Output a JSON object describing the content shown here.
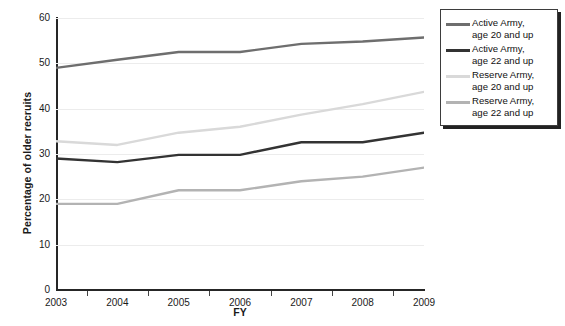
{
  "chart_data": {
    "type": "line",
    "title": "",
    "xlabel": "FY",
    "ylabel": "Percentage of older recruits",
    "categories": [
      "2003",
      "2004",
      "2005",
      "2006",
      "2007",
      "2008",
      "2009"
    ],
    "x": [
      2003,
      2004,
      2005,
      2006,
      2007,
      2008,
      2009
    ],
    "xlim": [
      2003,
      2009
    ],
    "ylim": [
      0,
      60
    ],
    "yticks": [
      0,
      10,
      20,
      30,
      40,
      50,
      60
    ],
    "ytick_labels": [
      "0",
      "10",
      "20",
      "30",
      "40",
      "50",
      "60"
    ],
    "grid": true,
    "grid_axis": "y",
    "legend_position": "right",
    "series": [
      {
        "name": "Active Army,\nage 20 and up",
        "color": "#6e6e6e",
        "values": [
          49.0,
          50.8,
          52.5,
          52.5,
          54.3,
          54.8,
          55.7
        ]
      },
      {
        "name": "Active Army,\nage 22 and up",
        "color": "#333333",
        "values": [
          29.0,
          28.2,
          29.8,
          29.8,
          32.6,
          32.6,
          34.7
        ]
      },
      {
        "name": "Reserve Army,\nage 20 and up",
        "color": "#d9d9d9",
        "values": [
          32.8,
          32.0,
          34.7,
          36.0,
          38.7,
          41.0,
          43.7
        ]
      },
      {
        "name": "Reserve Army,\nage 22 and up",
        "color": "#b3b3b3",
        "values": [
          19.0,
          19.0,
          22.0,
          22.0,
          24.0,
          25.0,
          27.0
        ]
      }
    ]
  },
  "legend": {
    "items": [
      {
        "label": "Active Army,\nage 20 and up",
        "color": "#6e6e6e"
      },
      {
        "label": "Active Army,\nage 22 and up",
        "color": "#333333"
      },
      {
        "label": "Reserve Army,\nage 20 and up",
        "color": "#d9d9d9"
      },
      {
        "label": "Reserve Army,\nage 22 and up",
        "color": "#b3b3b3"
      }
    ]
  }
}
